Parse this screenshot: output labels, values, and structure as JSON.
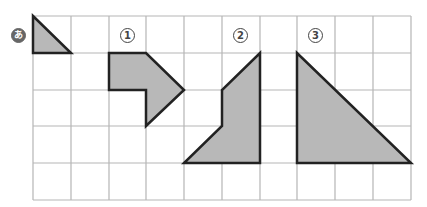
{
  "grid": {
    "cols": 10,
    "rows": 5,
    "x_lines": [
      33,
      71,
      109,
      146,
      184,
      222,
      260,
      297,
      335,
      373,
      411
    ],
    "y_lines": [
      16,
      53,
      90,
      126,
      163,
      200
    ],
    "line_color": "#b5b5b5",
    "fill_color": "#b8b8b8",
    "stroke_color": "#222222"
  },
  "labels": [
    {
      "id": "a",
      "text": "あ",
      "x": 12,
      "y": 25
    },
    {
      "id": "1",
      "text": "1",
      "x": 121,
      "y": 27
    },
    {
      "id": "2",
      "text": "2",
      "x": 234,
      "y": 27
    },
    {
      "id": "3",
      "text": "3",
      "x": 309,
      "y": 27
    }
  ],
  "shapes": [
    {
      "name": "shape-a",
      "points": "33,16 71,53 33,53"
    },
    {
      "name": "shape-1",
      "points": "109,53 146,53 184,90 146,126 146,90 109,90"
    },
    {
      "name": "shape-2",
      "points": "260,53 260,163 184,163 222,126 222,90"
    },
    {
      "name": "shape-3",
      "points": "297,53 297,163 411,163"
    }
  ]
}
